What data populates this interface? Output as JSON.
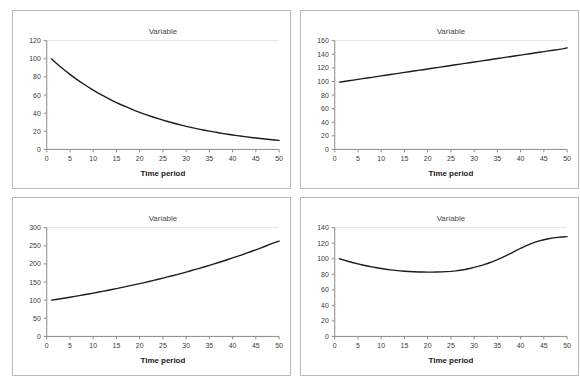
{
  "page": {
    "background_color": "#ffffff",
    "panel_border_color": "#b8b8b8",
    "series_color": "#1c1c1c",
    "axis_color": "#8a8a8a",
    "layout": "2x2 grid of line charts"
  },
  "chart_data": [
    {
      "id": "panel-top-left",
      "type": "line",
      "title": "Variable",
      "xlabel": "Time period",
      "ylabel": "",
      "xlim": [
        0,
        50
      ],
      "ylim": [
        0,
        120
      ],
      "xticks": [
        0,
        5,
        10,
        15,
        20,
        25,
        30,
        35,
        40,
        45,
        50
      ],
      "yticks": [
        0,
        20,
        40,
        60,
        80,
        100,
        120
      ],
      "grid": false,
      "legend": "none",
      "description": "exponential decay",
      "x": [
        1,
        2,
        3,
        4,
        5,
        6,
        7,
        8,
        9,
        10,
        11,
        12,
        13,
        14,
        15,
        16,
        17,
        18,
        19,
        20,
        21,
        22,
        23,
        24,
        25,
        26,
        27,
        28,
        29,
        30,
        31,
        32,
        33,
        34,
        35,
        36,
        37,
        38,
        39,
        40,
        41,
        42,
        43,
        44,
        45,
        46,
        47,
        48,
        49,
        50
      ],
      "values": [
        100.0,
        95.4,
        91.0,
        86.8,
        82.8,
        79.0,
        75.4,
        71.9,
        68.6,
        65.4,
        62.4,
        59.6,
        56.8,
        54.2,
        51.7,
        49.3,
        47.1,
        44.9,
        42.8,
        40.9,
        39.0,
        37.2,
        35.5,
        33.9,
        32.3,
        30.8,
        29.4,
        28.1,
        26.8,
        25.5,
        24.4,
        23.2,
        22.2,
        21.2,
        20.2,
        19.3,
        18.4,
        17.5,
        16.7,
        15.9,
        15.2,
        14.5,
        13.8,
        13.2,
        12.6,
        12.0,
        11.5,
        10.9,
        10.4,
        10.0
      ]
    },
    {
      "id": "panel-top-right",
      "type": "line",
      "title": "Variable",
      "xlabel": "Time period",
      "ylabel": "",
      "xlim": [
        0,
        50
      ],
      "ylim": [
        0,
        160
      ],
      "xticks": [
        0,
        5,
        10,
        15,
        20,
        25,
        30,
        35,
        40,
        45,
        50
      ],
      "yticks": [
        0,
        20,
        40,
        60,
        80,
        100,
        120,
        140,
        160
      ],
      "grid": false,
      "legend": "none",
      "description": "linear increase",
      "x": [
        1,
        2,
        3,
        4,
        5,
        6,
        7,
        8,
        9,
        10,
        11,
        12,
        13,
        14,
        15,
        16,
        17,
        18,
        19,
        20,
        21,
        22,
        23,
        24,
        25,
        26,
        27,
        28,
        29,
        30,
        31,
        32,
        33,
        34,
        35,
        36,
        37,
        38,
        39,
        40,
        41,
        42,
        43,
        44,
        45,
        46,
        47,
        48,
        49,
        50
      ],
      "values": [
        99.0,
        100.0,
        101.0,
        102.0,
        103.1,
        104.1,
        105.1,
        106.1,
        107.1,
        108.2,
        109.2,
        110.2,
        111.2,
        112.2,
        113.3,
        114.3,
        115.3,
        116.3,
        117.3,
        118.4,
        119.4,
        120.4,
        121.4,
        122.4,
        123.5,
        124.5,
        125.5,
        126.5,
        127.6,
        128.6,
        129.6,
        130.6,
        131.6,
        132.7,
        133.7,
        134.7,
        135.7,
        136.7,
        137.8,
        138.8,
        139.8,
        140.8,
        141.8,
        142.9,
        143.9,
        144.9,
        145.9,
        146.9,
        148.0,
        149.5
      ]
    },
    {
      "id": "panel-bottom-left",
      "type": "line",
      "title": "Variable",
      "xlabel": "Time period",
      "ylabel": "",
      "xlim": [
        0,
        50
      ],
      "ylim": [
        0,
        300
      ],
      "xticks": [
        0,
        5,
        10,
        15,
        20,
        25,
        30,
        35,
        40,
        45,
        50
      ],
      "yticks": [
        0,
        50,
        100,
        150,
        200,
        250,
        300
      ],
      "grid": false,
      "legend": "none",
      "description": "exponential growth",
      "x": [
        1,
        2,
        3,
        4,
        5,
        6,
        7,
        8,
        9,
        10,
        11,
        12,
        13,
        14,
        15,
        16,
        17,
        18,
        19,
        20,
        21,
        22,
        23,
        24,
        25,
        26,
        27,
        28,
        29,
        30,
        31,
        32,
        33,
        34,
        35,
        36,
        37,
        38,
        39,
        40,
        41,
        42,
        43,
        44,
        45,
        46,
        47,
        48,
        49,
        50
      ],
      "values": [
        100.0,
        102.0,
        104.0,
        106.1,
        108.2,
        110.4,
        112.6,
        114.9,
        117.2,
        119.5,
        121.9,
        124.3,
        126.8,
        129.4,
        131.9,
        134.6,
        137.3,
        140.0,
        142.8,
        145.7,
        148.6,
        151.6,
        154.6,
        157.7,
        160.8,
        164.1,
        167.3,
        170.7,
        174.1,
        177.6,
        181.1,
        184.8,
        188.5,
        192.2,
        196.1,
        200.0,
        204.0,
        208.1,
        212.2,
        216.5,
        220.8,
        225.2,
        229.7,
        234.3,
        239.0,
        243.8,
        248.7,
        253.7,
        258.7,
        263.0
      ]
    },
    {
      "id": "panel-bottom-right",
      "type": "line",
      "title": "Variable",
      "xlabel": "Time period",
      "ylabel": "",
      "xlim": [
        0,
        50
      ],
      "ylim": [
        0,
        140
      ],
      "xticks": [
        0,
        5,
        10,
        15,
        20,
        25,
        30,
        35,
        40,
        45,
        50
      ],
      "yticks": [
        0,
        20,
        40,
        60,
        80,
        100,
        120,
        140
      ],
      "grid": false,
      "legend": "none",
      "description": "U-shaped quadratic with minimum near period 21",
      "x": [
        1,
        2,
        3,
        4,
        5,
        6,
        7,
        8,
        9,
        10,
        11,
        12,
        13,
        14,
        15,
        16,
        17,
        18,
        19,
        20,
        21,
        22,
        23,
        24,
        25,
        26,
        27,
        28,
        29,
        30,
        31,
        32,
        33,
        34,
        35,
        36,
        37,
        38,
        39,
        40,
        41,
        42,
        43,
        44,
        45,
        46,
        47,
        48,
        49,
        50
      ],
      "values": [
        100.0,
        98.2,
        96.5,
        94.9,
        93.4,
        92.0,
        90.7,
        89.5,
        88.4,
        87.4,
        86.5,
        85.7,
        85.0,
        84.4,
        83.9,
        83.5,
        83.2,
        83.0,
        82.9,
        82.8,
        82.8,
        82.9,
        83.1,
        83.4,
        83.8,
        84.4,
        85.2,
        86.2,
        87.4,
        88.8,
        90.4,
        92.2,
        94.2,
        96.4,
        98.8,
        101.4,
        104.2,
        107.2,
        110.4,
        113.5,
        116.3,
        118.8,
        121.0,
        122.9,
        124.5,
        125.8,
        126.8,
        127.5,
        128.0,
        128.4
      ]
    }
  ]
}
